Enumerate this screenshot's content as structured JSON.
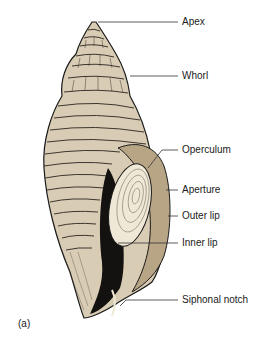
{
  "figure": {
    "panel_label": "(a)",
    "colors": {
      "shell_fill": "#d9ccb5",
      "shell_shadow": "#b8a585",
      "ink": "#1a1a1a",
      "operculum_fill": "#efe8d6",
      "aperture_dark": "#141210",
      "leader_line": "#333333"
    }
  },
  "labels": [
    {
      "id": "apex",
      "text": "Apex"
    },
    {
      "id": "whorl",
      "text": "Whorl"
    },
    {
      "id": "operculum",
      "text": "Operculum"
    },
    {
      "id": "aperture",
      "text": "Aperture"
    },
    {
      "id": "outer-lip",
      "text": "Outer lip"
    },
    {
      "id": "inner-lip",
      "text": "Inner lip"
    },
    {
      "id": "siphonal-notch",
      "text": "Siphonal notch"
    }
  ]
}
